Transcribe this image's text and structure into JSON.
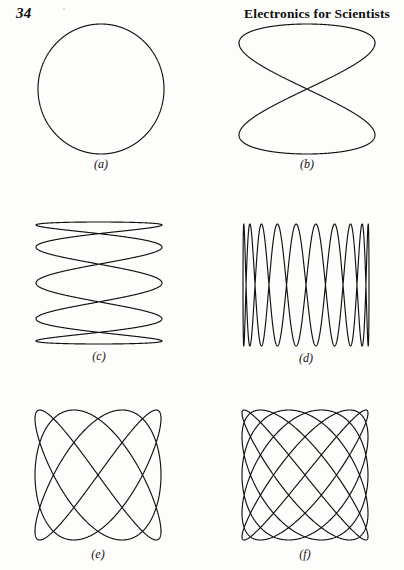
{
  "header": {
    "page_number": "34",
    "book_title": "Electronics for Scientists"
  },
  "figures": [
    {
      "id": "a",
      "label": "(a)",
      "caption_text": "(a)",
      "shape": "circle",
      "x": 0,
      "y": 22,
      "plot_width": 130,
      "plot_height": 134,
      "plot_offset_x": 0,
      "label_top": 2
    },
    {
      "id": "b",
      "label": "(b)",
      "caption_text": "(b)",
      "shape": "figure-eight",
      "x": 202,
      "y": 22,
      "plot_width": 140,
      "plot_height": 134,
      "plot_offset_x": 8,
      "label_top": 2
    },
    {
      "id": "c",
      "label": "(c)",
      "caption_text": "(c)",
      "shape": "tall-loops",
      "x": 0,
      "y": 220,
      "plot_width": 130,
      "plot_height": 126,
      "plot_offset_x": -4,
      "label_top": 4
    },
    {
      "id": "d",
      "label": "(d)",
      "caption_text": "(d)",
      "shape": "flat-loops",
      "x": 202,
      "y": 222,
      "plot_width": 130,
      "plot_height": 126,
      "plot_offset_x": 6,
      "label_top": 4
    },
    {
      "id": "e",
      "label": "(e)",
      "caption_text": "(e)",
      "shape": "woven-3-4",
      "x": 0,
      "y": 408,
      "plot_width": 130,
      "plot_height": 134,
      "plot_offset_x": -6,
      "label_top": 6
    },
    {
      "id": "f",
      "label": "(f)",
      "caption_text": "(f)",
      "shape": "woven-5-6",
      "x": 202,
      "y": 408,
      "plot_width": 130,
      "plot_height": 134,
      "plot_offset_x": 4,
      "label_top": 6
    }
  ],
  "chart_data": {
    "type": "line",
    "xlabel": "",
    "ylabel": "",
    "grid": false,
    "legend": "none",
    "axis_range_x": [
      -1,
      1
    ],
    "axis_range_y": [
      -1,
      1
    ],
    "series": [
      {
        "name": "(a)",
        "label": "(a)",
        "freq_ratio": "1:1",
        "freq_x": 1,
        "freq_y": 1,
        "phase_deg": 90,
        "curve": "x = sin(t), y = sin(t + 90deg)",
        "appearance": "circle",
        "crossings": 0
      },
      {
        "name": "(b)",
        "label": "(b)",
        "freq_ratio": "1:2",
        "freq_x": 1,
        "freq_y": 2,
        "phase_deg": 0,
        "curve": "x = sin(t), y = sin(2t)",
        "appearance": "figure-eight / bowtie, two stacked lobes",
        "crossings": 1
      },
      {
        "name": "(c)",
        "label": "(c)",
        "freq_ratio": "5:1",
        "freq_x": 5,
        "freq_y": 1,
        "phase_deg": 90,
        "curve": "x = sin(5t + 90deg), y = sin(t)",
        "appearance": "five tall narrow vertical loops",
        "crossings": 8
      },
      {
        "name": "(d)",
        "label": "(d)",
        "freq_ratio": "1:10",
        "freq_x": 1,
        "freq_y": 10,
        "phase_deg": 90,
        "curve": "x = sin(t), y = sin(10t + 90deg)",
        "appearance": "ten flat wide horizontal loops stacked",
        "crossings": 18
      },
      {
        "name": "(e)",
        "label": "(e)",
        "freq_ratio": "3:4",
        "freq_x": 3,
        "freq_y": 4,
        "phase_deg": 90,
        "curve": "x = sin(3t + 90deg), y = sin(4t)",
        "appearance": "woven lattice, 3 lobes across, 4 lobes high",
        "crossings": 12
      },
      {
        "name": "(f)",
        "label": "(f)",
        "freq_ratio": "5:6",
        "freq_x": 5,
        "freq_y": 6,
        "phase_deg": 90,
        "curve": "x = sin(5t + 90deg), y = sin(6t)",
        "appearance": "dense woven lattice, near-square with rounded corners",
        "crossings": 30
      }
    ]
  },
  "style": {
    "ink_color": "#111111",
    "paper_color": "#fdfdfb",
    "stroke_width": 1.15
  }
}
